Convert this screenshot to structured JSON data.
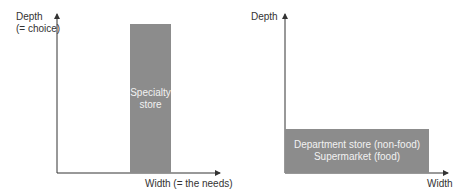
{
  "left_chart": {
    "y_label_line1": "Depth",
    "y_label_line2": "(= choice)",
    "x_label": "Width (= the needs)",
    "bar_line1": "Specialty",
    "bar_line2": "store"
  },
  "right_chart": {
    "y_label": "Depth",
    "x_label": "Width",
    "bar_line1": "Department store (non-food)",
    "bar_line2": "Supermarket (food)"
  },
  "colors": {
    "bar": "#8c8c8c",
    "axis": "#333333"
  }
}
